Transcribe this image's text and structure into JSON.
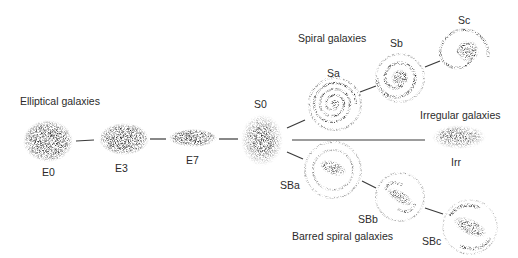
{
  "diagram": {
    "groups": {
      "elliptical": "Elliptical galaxies",
      "spiral": "Spiral galaxies",
      "barred": "Barred spiral galaxies",
      "irregular": "Irregular galaxies"
    },
    "nodes": [
      {
        "id": "E0",
        "label": "E0",
        "type": "elliptical",
        "cx": 48,
        "cy": 141,
        "rx": 23,
        "ry": 19
      },
      {
        "id": "E3",
        "label": "E3",
        "type": "elliptical",
        "cx": 124,
        "cy": 139,
        "rx": 23,
        "ry": 15
      },
      {
        "id": "E7",
        "label": "E7",
        "type": "elliptical",
        "cx": 193,
        "cy": 138,
        "rx": 22,
        "ry": 8
      },
      {
        "id": "S0",
        "label": "S0",
        "type": "lenticular",
        "cx": 262,
        "cy": 140,
        "rx": 19,
        "ry": 24
      },
      {
        "id": "Sa",
        "label": "Sa",
        "type": "spiral",
        "cx": 335,
        "cy": 104,
        "r": 26
      },
      {
        "id": "Sb",
        "label": "Sb",
        "type": "spiral",
        "cx": 400,
        "cy": 78,
        "r": 24
      },
      {
        "id": "Sc",
        "label": "Sc",
        "type": "spiral",
        "cx": 466,
        "cy": 51,
        "r": 27
      },
      {
        "id": "SBa",
        "label": "SBa",
        "type": "barred",
        "cx": 333,
        "cy": 170,
        "r": 28
      },
      {
        "id": "SBb",
        "label": "SBb",
        "type": "barred",
        "cx": 400,
        "cy": 197,
        "r": 24
      },
      {
        "id": "SBc",
        "label": "SBc",
        "type": "barred",
        "cx": 470,
        "cy": 227,
        "r": 27
      },
      {
        "id": "Irr",
        "label": "Irr",
        "type": "irregular",
        "cx": 459,
        "cy": 137,
        "rx": 25,
        "ry": 11
      }
    ],
    "edges": [
      [
        "E0",
        "E3"
      ],
      [
        "E3",
        "E7"
      ],
      [
        "E7",
        "S0"
      ],
      [
        "S0",
        "Sa"
      ],
      [
        "Sa",
        "Sb"
      ],
      [
        "Sb",
        "Sc"
      ],
      [
        "S0",
        "SBa"
      ],
      [
        "SBa",
        "SBb"
      ],
      [
        "SBb",
        "SBc"
      ],
      [
        "S0",
        "Irr"
      ]
    ],
    "colors": {
      "ink": "#2b2b2b",
      "stipple": "#1a1a1a",
      "background": "#ffffff"
    }
  }
}
